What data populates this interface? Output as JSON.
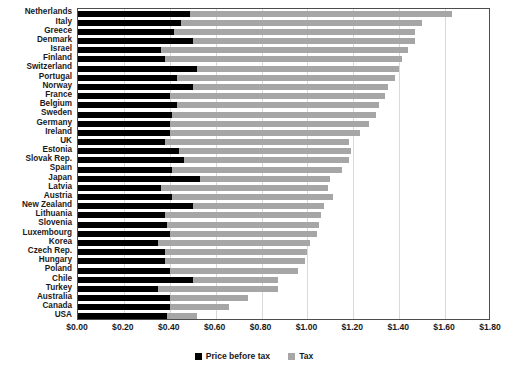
{
  "chart_data": {
    "type": "bar",
    "orientation": "horizontal",
    "stacked": true,
    "title": "",
    "subtitle": "",
    "xlabel": "",
    "ylabel": "",
    "xlim": [
      0.0,
      1.8
    ],
    "xtick_step": 0.2,
    "xticks": [
      "$0.00",
      "$0.20",
      "$0.40",
      "$0.60",
      "$0.80",
      "$1.00",
      "$1.20",
      "$1.40",
      "$1.60",
      "$1.80"
    ],
    "xtick_values": [
      0.0,
      0.2,
      0.4,
      0.6,
      0.8,
      1.0,
      1.2,
      1.4,
      1.6,
      1.8
    ],
    "grid": true,
    "grid_axis": "x",
    "legend_position": "bottom",
    "colors": {
      "price_before_tax": "#000000",
      "tax": "#a6a6a6",
      "grid": "#d9d9d9",
      "axis": "#4d4d4d"
    },
    "legend": [
      {
        "label": "Price before tax",
        "color": "#000000"
      },
      {
        "label": "Tax",
        "color": "#a6a6a6"
      }
    ],
    "categories": [
      "Netherlands",
      "Italy",
      "Greece",
      "Denmark",
      "Israel",
      "Finland",
      "Switzerland",
      "Portugal",
      "Norway",
      "France",
      "Belgium",
      "Sweden",
      "Germany",
      "Ireland",
      "UK",
      "Estonia",
      "Slovak Rep.",
      "Spain",
      "Japan",
      "Latvia",
      "Austria",
      "New Zealand",
      "Lithuania",
      "Slovenia",
      "Luxembourg",
      "Korea",
      "Czech Rep.",
      "Hungary",
      "Poland",
      "Chile",
      "Turkey",
      "Australia",
      "Canada",
      "USA"
    ],
    "series": [
      {
        "name": "Price before tax",
        "color": "#000000",
        "values": [
          0.49,
          0.45,
          0.42,
          0.5,
          0.36,
          0.38,
          0.52,
          0.43,
          0.5,
          0.4,
          0.43,
          0.41,
          0.4,
          0.4,
          0.38,
          0.44,
          0.46,
          0.41,
          0.53,
          0.36,
          0.41,
          0.5,
          0.38,
          0.39,
          0.4,
          0.35,
          0.38,
          0.38,
          0.4,
          0.5,
          0.35,
          0.4,
          0.4,
          0.39
        ]
      },
      {
        "name": "Tax",
        "color": "#a6a6a6",
        "values": [
          1.14,
          1.05,
          1.05,
          0.97,
          1.08,
          1.03,
          0.88,
          0.95,
          0.85,
          0.94,
          0.88,
          0.89,
          0.87,
          0.83,
          0.8,
          0.75,
          0.72,
          0.74,
          0.57,
          0.73,
          0.7,
          0.57,
          0.68,
          0.66,
          0.64,
          0.66,
          0.62,
          0.61,
          0.56,
          0.37,
          0.52,
          0.34,
          0.26,
          0.13
        ]
      }
    ],
    "totals": [
      1.63,
      1.5,
      1.47,
      1.47,
      1.44,
      1.41,
      1.4,
      1.38,
      1.35,
      1.34,
      1.31,
      1.3,
      1.27,
      1.23,
      1.18,
      1.19,
      1.18,
      1.15,
      1.1,
      1.09,
      1.11,
      1.07,
      1.06,
      1.05,
      1.04,
      1.01,
      1.0,
      0.99,
      0.96,
      0.87,
      0.87,
      0.74,
      0.66,
      0.52
    ]
  }
}
